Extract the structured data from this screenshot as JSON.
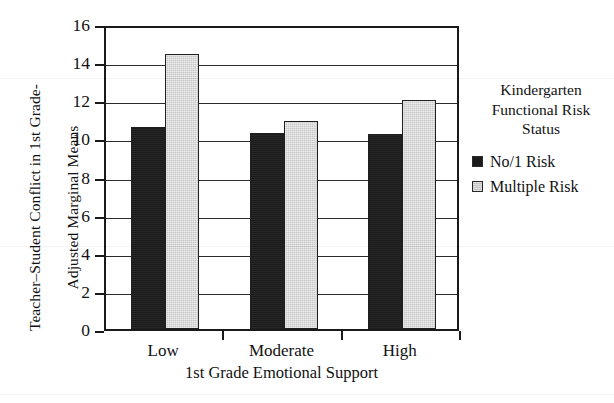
{
  "chart_data": {
    "type": "bar",
    "title": "",
    "categories": [
      "Low",
      "Moderate",
      "High"
    ],
    "series": [
      {
        "name": "No/1 Risk",
        "color": "#1b1b1b",
        "values": [
          10.6,
          10.3,
          10.25
        ]
      },
      {
        "name": "Multiple Risk",
        "color": "#c6c6c6",
        "values": [
          14.45,
          10.9,
          12.0
        ]
      }
    ],
    "xlabel": "1st Grade Emotional Support",
    "ylabel": "Teacher–Student Conflict in 1st Grade-Adjusted Marginal Means",
    "ylabel_line1": "Teacher–Student Conflict in 1st Grade-",
    "ylabel_line2": "Adjusted Marginal Means",
    "ylim": [
      0,
      16
    ],
    "ytick_step": 2,
    "yticks": [
      "16",
      "14",
      "12",
      "10",
      "8",
      "6",
      "4",
      "2",
      "0"
    ],
    "grid": true,
    "legend_position": "right",
    "legend_title_line1": "Kindergarten",
    "legend_title_line2": "Functional Risk",
    "legend_title_line3": "Status"
  },
  "axis": {
    "y_title_line1": "Teacher–Student Conflict in 1st Grade-",
    "y_title_line2": "Adjusted Marginal Means",
    "x_title": "1st Grade Emotional Support"
  },
  "legend": {
    "title_line1": "Kindergarten",
    "title_line2": "Functional Risk",
    "title_line3": "Status",
    "items": [
      {
        "label": "No/1 Risk",
        "swatch": "dark"
      },
      {
        "label": "Multiple Risk",
        "swatch": "light"
      }
    ]
  }
}
